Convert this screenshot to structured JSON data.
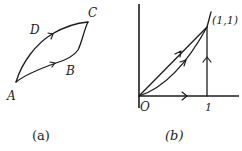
{
  "figure_a": {
    "caption": "(a)",
    "points": {
      "A": "A",
      "B": "B",
      "C": "C",
      "D": "D"
    },
    "paths": [
      {
        "name": "path-ADC",
        "via": "D",
        "from": "A",
        "to": "C"
      },
      {
        "name": "path-ABC",
        "via": "B",
        "from": "A",
        "to": "C"
      }
    ]
  },
  "figure_b": {
    "caption": "(b)",
    "origin_label": "O",
    "x_tick_label": "1",
    "point_label": "(1,1)",
    "paths": [
      {
        "name": "straight-line",
        "description": "O to (1,1) along y = x"
      },
      {
        "name": "parabola",
        "description": "O to (1,1) along curve"
      },
      {
        "name": "x-axis-segment",
        "description": "O to (1,0)"
      },
      {
        "name": "vertical-segment",
        "description": "(1,0) to (1,1)"
      }
    ]
  },
  "colors": {
    "ink": "#1c1c1c",
    "background": "#ffffff"
  }
}
